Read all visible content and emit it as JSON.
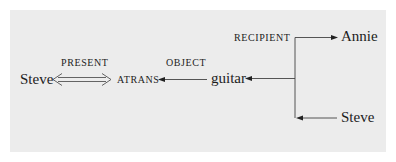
{
  "diagram": {
    "type": "conceptual-dependency",
    "nodes": {
      "actor": "Steve",
      "primitive": "ATRANS",
      "object": "guitar",
      "recipient_to": "Annie",
      "recipient_from": "Steve"
    },
    "relations": {
      "tense": "PRESENT",
      "object": "OBJECT",
      "recipient": "RECIPIENT"
    },
    "colors": {
      "background": "#ececec",
      "ink": "#1c1c1c"
    }
  }
}
